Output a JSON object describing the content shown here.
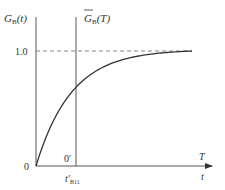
{
  "chart_data": {
    "type": "line",
    "title": "",
    "ylabel": "G_B(t)",
    "ylabel_main": "G",
    "ylabel_sub": "B",
    "ylabel_arg": "(t)",
    "ylabel2_main": "G",
    "ylabel2_sub": "B",
    "ylabel2_arg": "(T)",
    "ylabel2": "overline G_B(T)",
    "xlabel_upper": "T",
    "xlabel_lower": "t",
    "origin_label": "0",
    "origin2_label": "0′",
    "x2_tick_main": "t′",
    "x2_tick_sub": "B11",
    "ytick_label": "1.0",
    "asymptote_value": 1.0,
    "ylim": [
      0,
      1.0
    ],
    "xlim": [
      0,
      1
    ],
    "shifted_origin_x": 0.256,
    "curve": {
      "name": "G_B(t)",
      "form": "1 - exp(-k t)",
      "k": 4.4,
      "plateau_at": 1.0
    },
    "grid": false
  }
}
